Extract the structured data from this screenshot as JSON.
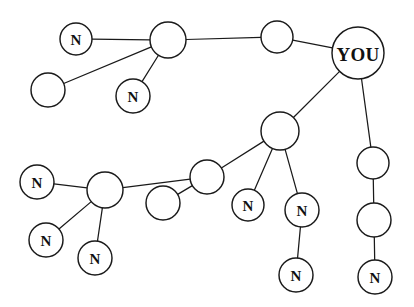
{
  "figure": {
    "name": "social-network-graph",
    "width": 414,
    "height": 307,
    "background_color": "#ffffff",
    "node_fill_color": "#ffffff",
    "node_stroke_color": "#1a1a1a",
    "edge_color": "#1a1a1a",
    "label_color": "#111111"
  },
  "chart_data": {
    "type": "diagram",
    "subtype": "node-link-network",
    "title": "",
    "directed": false,
    "node_count": 18,
    "edge_count": 17,
    "labels_used": [
      "YOU",
      "N"
    ],
    "nodes": [
      {
        "id": "you",
        "label": "YOU",
        "x": 358,
        "y": 53,
        "r": 26
      },
      {
        "id": "t_mid",
        "label": "",
        "x": 277,
        "y": 37,
        "r": 16
      },
      {
        "id": "t_hub",
        "label": "",
        "x": 168,
        "y": 40,
        "r": 18
      },
      {
        "id": "t_n_left",
        "label": "N",
        "x": 76,
        "y": 39,
        "r": 16
      },
      {
        "id": "t_blank",
        "label": "",
        "x": 48,
        "y": 90,
        "r": 17
      },
      {
        "id": "t_n_low",
        "label": "N",
        "x": 133,
        "y": 96,
        "r": 17
      },
      {
        "id": "c_hub",
        "label": "",
        "x": 280,
        "y": 131,
        "r": 19
      },
      {
        "id": "c_n_left",
        "label": "N",
        "x": 248,
        "y": 205,
        "r": 16
      },
      {
        "id": "c_n_right",
        "label": "N",
        "x": 302,
        "y": 210,
        "r": 17
      },
      {
        "id": "c_n_tail",
        "label": "N",
        "x": 296,
        "y": 275,
        "r": 17
      },
      {
        "id": "m_node",
        "label": "",
        "x": 207,
        "y": 177,
        "r": 17
      },
      {
        "id": "m_blank",
        "label": "",
        "x": 163,
        "y": 203,
        "r": 17
      },
      {
        "id": "l_hub",
        "label": "",
        "x": 105,
        "y": 190,
        "r": 18
      },
      {
        "id": "l_n_up",
        "label": "N",
        "x": 37,
        "y": 182,
        "r": 17
      },
      {
        "id": "l_n_mid",
        "label": "N",
        "x": 46,
        "y": 240,
        "r": 17
      },
      {
        "id": "l_n_low",
        "label": "N",
        "x": 95,
        "y": 258,
        "r": 17
      },
      {
        "id": "r_chain_1",
        "label": "",
        "x": 373,
        "y": 163,
        "r": 16
      },
      {
        "id": "r_chain_2",
        "label": "",
        "x": 374,
        "y": 220,
        "r": 17
      },
      {
        "id": "r_chain_3",
        "label": "N",
        "x": 375,
        "y": 277,
        "r": 17
      }
    ],
    "edges": [
      {
        "source": "you",
        "target": "t_mid"
      },
      {
        "source": "t_mid",
        "target": "t_hub"
      },
      {
        "source": "t_hub",
        "target": "t_n_left"
      },
      {
        "source": "t_hub",
        "target": "t_blank"
      },
      {
        "source": "t_hub",
        "target": "t_n_low"
      },
      {
        "source": "you",
        "target": "c_hub"
      },
      {
        "source": "you",
        "target": "r_chain_1"
      },
      {
        "source": "r_chain_1",
        "target": "r_chain_2"
      },
      {
        "source": "r_chain_2",
        "target": "r_chain_3"
      },
      {
        "source": "c_hub",
        "target": "c_n_left"
      },
      {
        "source": "c_hub",
        "target": "c_n_right"
      },
      {
        "source": "c_n_right",
        "target": "c_n_tail"
      },
      {
        "source": "c_hub",
        "target": "m_node"
      },
      {
        "source": "m_node",
        "target": "m_blank"
      },
      {
        "source": "m_node",
        "target": "l_hub"
      },
      {
        "source": "l_hub",
        "target": "l_n_up"
      },
      {
        "source": "l_hub",
        "target": "l_n_mid"
      },
      {
        "source": "l_hub",
        "target": "l_n_low"
      }
    ]
  }
}
